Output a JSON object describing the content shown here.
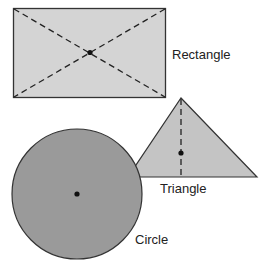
{
  "diagram": {
    "shapes": [
      {
        "id": "rectangle",
        "label": "Rectangle",
        "fill": "#d4d4d4"
      },
      {
        "id": "triangle",
        "label": "Triangle",
        "fill": "#c4c4c4"
      },
      {
        "id": "circle",
        "label": "Circle",
        "fill": "#9a9a9a"
      }
    ],
    "colors": {
      "stroke": "#333333",
      "dash": "#222222",
      "center_point": "#111111"
    }
  }
}
